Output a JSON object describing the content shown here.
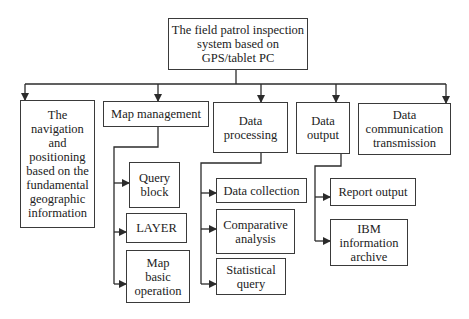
{
  "diagram": {
    "type": "hierarchy",
    "root": {
      "label": "The field patrol inspection\nsystem based on\nGPS/tablet PC"
    },
    "modules": [
      {
        "label": "The\nnavigation\nand\npositioning\nbased on the\nfundamental\ngeographic\ninformation",
        "children": []
      },
      {
        "label": "Map management",
        "children": [
          {
            "label": "Query\nblock"
          },
          {
            "label": "LAYER"
          },
          {
            "label": "Map\nbasic\noperation"
          }
        ]
      },
      {
        "label": "Data\nprocessing",
        "children": [
          {
            "label": "Data collection"
          },
          {
            "label": "Comparative\nanalysis"
          },
          {
            "label": "Statistical\nquery"
          }
        ]
      },
      {
        "label": "Data\noutput",
        "children": [
          {
            "label": "Report output"
          },
          {
            "label": "IBM\ninformation\narchive"
          }
        ]
      },
      {
        "label": "Data\ncommunication\ntransmission",
        "children": []
      }
    ],
    "line_color": "#2b2b2b",
    "box_border_color": "#3a3a3a"
  }
}
